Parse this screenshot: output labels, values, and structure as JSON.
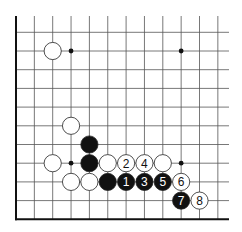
{
  "diagram": {
    "type": "go-board-fragment",
    "visible_columns": 12,
    "visible_rows": 11,
    "edges": [
      "left",
      "bottom"
    ],
    "colors": {
      "background": "#ffffff",
      "grid": "#555555",
      "edge": "#111111",
      "black_stone": "#111111",
      "white_stone": "#ffffff",
      "stone_outline": "#222222"
    },
    "star_points": [
      {
        "col": 3,
        "row": 1
      },
      {
        "col": 9,
        "row": 1
      },
      {
        "col": 3,
        "row": 7
      },
      {
        "col": 9,
        "row": 7
      }
    ],
    "stones": [
      {
        "col": 2,
        "row": 1,
        "color": "white",
        "label": ""
      },
      {
        "col": 3,
        "row": 5,
        "color": "white",
        "label": ""
      },
      {
        "col": 4,
        "row": 6,
        "color": "black",
        "label": ""
      },
      {
        "col": 2,
        "row": 7,
        "color": "white",
        "label": ""
      },
      {
        "col": 4,
        "row": 7,
        "color": "black",
        "label": ""
      },
      {
        "col": 5,
        "row": 7,
        "color": "white",
        "label": ""
      },
      {
        "col": 6,
        "row": 7,
        "color": "white",
        "label": "2"
      },
      {
        "col": 7,
        "row": 7,
        "color": "white",
        "label": "4"
      },
      {
        "col": 8,
        "row": 7,
        "color": "white",
        "label": ""
      },
      {
        "col": 3,
        "row": 8,
        "color": "white",
        "label": ""
      },
      {
        "col": 4,
        "row": 8,
        "color": "white",
        "label": ""
      },
      {
        "col": 5,
        "row": 8,
        "color": "black",
        "label": ""
      },
      {
        "col": 6,
        "row": 8,
        "color": "black",
        "label": "1"
      },
      {
        "col": 7,
        "row": 8,
        "color": "black",
        "label": "3"
      },
      {
        "col": 8,
        "row": 8,
        "color": "black",
        "label": "5"
      },
      {
        "col": 9,
        "row": 8,
        "color": "white",
        "label": "6"
      },
      {
        "col": 9,
        "row": 9,
        "color": "black",
        "label": "7"
      },
      {
        "col": 10,
        "row": 9,
        "color": "white",
        "label": "8"
      }
    ]
  }
}
